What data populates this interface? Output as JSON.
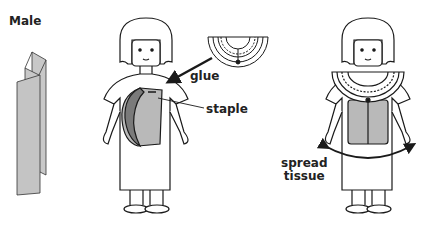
{
  "title": "Male",
  "labels": {
    "glue": "glue",
    "staple": "staple",
    "spread_line1": "spread",
    "spread_line2": "tissue"
  },
  "colors": {
    "outline": "#1a1a1a",
    "tissue_light": "#b9b9b9",
    "tissue_dark": "#7a7a7a",
    "fold_paper": "#c8c8c8"
  },
  "figures": [
    {
      "name": "folded-tissue-paper",
      "description": "accordion-folded tissue strip"
    },
    {
      "name": "figure-step-1",
      "description": "figure with tissue loop stapled to chest, collar to be glued"
    },
    {
      "name": "figure-step-2",
      "description": "figure wearing collar with tissue spread across body"
    }
  ]
}
